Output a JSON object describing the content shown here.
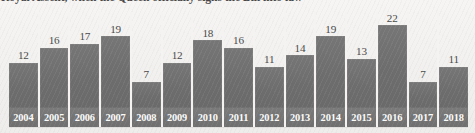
{
  "caption": {
    "text": "Royal Assent, when the Queen officially signs the Bill into law"
  },
  "colors": {
    "bar_fill": "#6d6d6d",
    "year_band": "#757575",
    "year_label": "#fbfbfa",
    "value_label": "#4a4a4a",
    "background": "#f1f0ee"
  },
  "chart_data": {
    "type": "bar",
    "title": "",
    "xlabel": "",
    "ylabel": "",
    "ylim": [
      0,
      22
    ],
    "grid": false,
    "legend": null,
    "categories": [
      "2004",
      "2005",
      "2006",
      "2007",
      "2008",
      "2009",
      "2010",
      "2011",
      "2012",
      "2013",
      "2014",
      "2015",
      "2016",
      "2017",
      "2018"
    ],
    "values": [
      12,
      16,
      17,
      19,
      7,
      12,
      18,
      16,
      11,
      14,
      19,
      13,
      22,
      7,
      11
    ],
    "data_labels": [
      "12",
      "16",
      "17",
      "19",
      "7",
      "12",
      "18",
      "16",
      "11",
      "14",
      "19",
      "13",
      "22",
      "7",
      "11"
    ],
    "tick_labels": [
      "2004",
      "2005",
      "2006",
      "2007",
      "2008",
      "2009",
      "2010",
      "2011",
      "2012",
      "2013",
      "2014",
      "2015",
      "2016",
      "2017",
      "2018"
    ]
  }
}
